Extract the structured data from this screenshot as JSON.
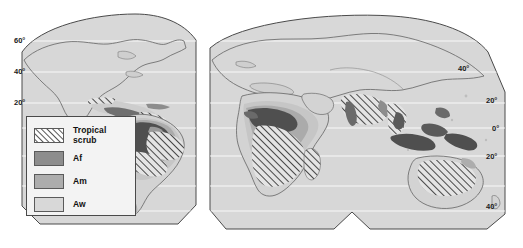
{
  "figure": {
    "projection": "interrupted (Goode-style) equal-area",
    "background_color": "#ffffff",
    "land_fill": "#d8d8d8",
    "outline_color": "#4a4a4a"
  },
  "legend": {
    "box_fill": "#f3f3f3",
    "box_border": "#4a4a4a",
    "items": [
      {
        "label": "Tropical\nscrub",
        "label_line1": "Tropical",
        "label_line2": "scrub",
        "pattern": "diagonal-hatch",
        "color": "#ffffff",
        "swatch_name": "swatch-tropical-scrub"
      },
      {
        "label": "Af",
        "label_line1": "Af",
        "label_line2": "",
        "pattern": "solid",
        "color": "#8d8d8d",
        "swatch_name": "swatch-af"
      },
      {
        "label": "Am",
        "label_line1": "Am",
        "label_line2": "",
        "pattern": "solid",
        "color": "#adadad",
        "swatch_name": "swatch-am"
      },
      {
        "label": "Aw",
        "label_line1": "Aw",
        "label_line2": "",
        "pattern": "solid",
        "color": "#d8d8d8",
        "swatch_name": "swatch-aw"
      }
    ]
  },
  "graticule": {
    "left_labels": [
      {
        "text": "60°",
        "x": 14,
        "y": 41
      },
      {
        "text": "40°",
        "x": 14,
        "y": 72
      },
      {
        "text": "20°",
        "x": 14,
        "y": 103
      }
    ],
    "right_labels": [
      {
        "text": "40°",
        "x": 458,
        "y": 68
      },
      {
        "text": "20°",
        "x": 486,
        "y": 100
      },
      {
        "text": "0°",
        "x": 492,
        "y": 128
      },
      {
        "text": "20°",
        "x": 486,
        "y": 156
      },
      {
        "text": "40°",
        "x": 486,
        "y": 206
      }
    ],
    "parallels_y": [
      41,
      72,
      103,
      128,
      156,
      186,
      211
    ]
  },
  "panels": [
    {
      "name": "americas-panel",
      "region": "Americas"
    },
    {
      "name": "afroeurasia-panel",
      "region": "Africa, Eurasia and Australia"
    }
  ]
}
